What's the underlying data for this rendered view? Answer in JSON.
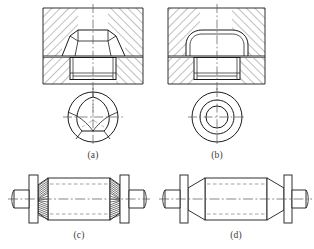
{
  "sheet": {
    "title": "",
    "background_color": "#ffffff",
    "line_color": "#1a1a1a",
    "caption_color": "#3a3a3a"
  },
  "figures": [
    {
      "id": "figure-a",
      "caption": "(a)",
      "description": "Sectional view of faceted conical-head fastener seated in hatched housing, with three-lobe bottom end view",
      "views": [
        "section-view",
        "bottom-end-view"
      ],
      "head_type": "faceted-cone",
      "end_view_shape": "three-lobe",
      "hatching": "true"
    },
    {
      "id": "figure-b",
      "caption": "(b)",
      "description": "Sectional view of smooth round-head fastener seated in hatched housing, with concentric-circle bottom end view",
      "views": [
        "section-view",
        "bottom-end-view"
      ],
      "head_type": "round-cone",
      "end_view_shape": "concentric-circles",
      "hatching": "true"
    },
    {
      "id": "figure-c",
      "caption": "(c)",
      "description": "Elevation of shaft with two serrated splined conical ends and hidden centre bore",
      "views": [
        "elevation"
      ],
      "end_type": "serrated-cone",
      "hidden_lines": "true"
    },
    {
      "id": "figure-d",
      "caption": "(d)",
      "description": "Elevation of shaft with two plain conical ends and hidden centre bore",
      "views": [
        "elevation"
      ],
      "end_type": "plain-cone",
      "hidden_lines": "true"
    }
  ],
  "colors": {
    "stroke": "#1a1a1a",
    "hatch": "#4a4a4a",
    "centerline": "#555555",
    "hidden": "#555555",
    "paper": "#ffffff"
  }
}
